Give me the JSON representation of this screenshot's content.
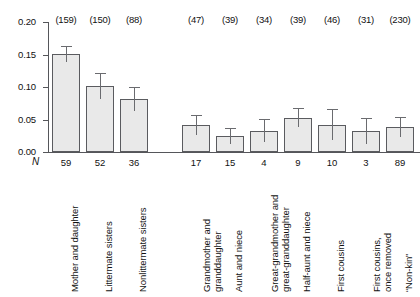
{
  "chart_data": {
    "type": "bar",
    "title": "",
    "xlabel": "",
    "ylabel": "",
    "ylim": [
      0.0,
      0.2
    ],
    "ytick_labels": [
      "0.20",
      "0.15",
      "0.10",
      "0.05",
      "0.00"
    ],
    "ytick_values": [
      0.2,
      0.15,
      0.1,
      0.05,
      0.0
    ],
    "grid": false,
    "legend": null,
    "n_row_symbol": "N",
    "group_gap_after_index": 2,
    "categories": [
      "Mother and daughter",
      "Littermate sisters",
      "Nonlittermate sisters",
      "Grandmother and granddaughter",
      "Aunt and niece",
      "Great-grandmother and great-granddaughter",
      "Half-aunt and niece",
      "First cousins",
      "First cousins, once removed",
      "“Non-kin”"
    ],
    "category_lines": [
      [
        "Mother and daughter"
      ],
      [
        "Littermate sisters"
      ],
      [
        "Nonlittermate sisters"
      ],
      [
        "Grandmother and",
        "granddaughter"
      ],
      [
        "Aunt and niece"
      ],
      [
        "Great-grandmother and",
        "great-granddaughter"
      ],
      [
        "Half-aunt and niece"
      ],
      [
        "First cousins"
      ],
      [
        "First cousins,",
        "once removed"
      ],
      [
        "“Non-kin”"
      ]
    ],
    "values": [
      0.151,
      0.102,
      0.082,
      0.042,
      0.025,
      0.033,
      0.053,
      0.042,
      0.033,
      0.038
    ],
    "err_low": [
      0.138,
      0.081,
      0.063,
      0.026,
      0.012,
      0.015,
      0.038,
      0.018,
      0.013,
      0.023
    ],
    "err_high": [
      0.163,
      0.122,
      0.1,
      0.057,
      0.037,
      0.051,
      0.068,
      0.066,
      0.053,
      0.054
    ],
    "paren_counts": [
      "(159)",
      "(150)",
      "(88)",
      "(47)",
      "(39)",
      "(34)",
      "(39)",
      "(46)",
      "(31)",
      "(230)"
    ],
    "n_values": [
      "59",
      "52",
      "36",
      "17",
      "15",
      "4",
      "9",
      "10",
      "3",
      "89"
    ],
    "colors": {
      "bar_fill": "#e9e9e9",
      "bar_border": "#5a5b5f",
      "axis": "#55565a",
      "error_bar": "#6a6b6f",
      "text": "#111111",
      "background": "#ffffff"
    }
  }
}
